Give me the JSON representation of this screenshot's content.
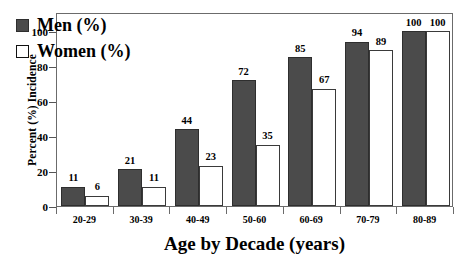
{
  "chart_data": {
    "type": "bar",
    "title": "",
    "xlabel": "Age by Decade (years)",
    "ylabel": "Percent (%) Incidence",
    "categories": [
      "20-29",
      "30-39",
      "40-49",
      "50-60",
      "60-69",
      "70-79",
      "80-89"
    ],
    "series": [
      {
        "name": "Men (%)",
        "values": [
          11,
          21,
          44,
          72,
          85,
          94,
          100
        ],
        "color": "#4b4b4b"
      },
      {
        "name": "Women (%)",
        "values": [
          6,
          11,
          23,
          35,
          67,
          89,
          100
        ],
        "color": "#ffffff"
      }
    ],
    "ylim": [
      0,
      100
    ],
    "yticks": [
      0,
      20,
      40,
      60,
      80,
      100
    ],
    "ytick_labels": [
      "0",
      "20",
      "40",
      "60",
      "80",
      "100"
    ],
    "grid": false,
    "legend_position": "upper-left-inside",
    "data_labels": true
  },
  "legend": {
    "items": [
      {
        "label": "Men (%)",
        "swatch": "filled-gray-square"
      },
      {
        "label": "Women (%)",
        "swatch": "open-white-square"
      }
    ]
  }
}
